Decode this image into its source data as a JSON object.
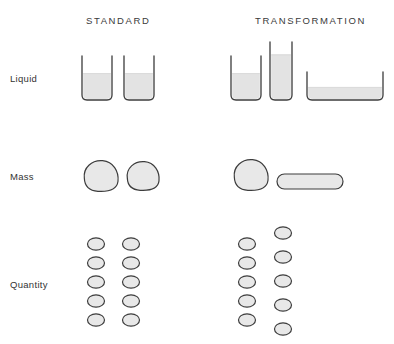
{
  "figure": {
    "title_columns": {
      "standard": "STANDARD",
      "transformation": "TRANSFORMATION"
    },
    "row_labels": {
      "liquid": "Liquid",
      "mass": "Mass",
      "quantity": "Quantity"
    },
    "colors": {
      "background": "#ffffff",
      "outline": "#3c3c3c",
      "fill_light": "#e8e8e8",
      "fill_liquid": "#e3e3e3",
      "text": "#333333"
    }
  },
  "chart_data": {
    "type": "diagram",
    "title": "",
    "rows": [
      {
        "label": "Liquid",
        "standard": {
          "items": [
            {
              "shape": "beaker",
              "x": 82,
              "y": 56,
              "width": 30,
              "height": 44,
              "fill_ratio": 0.6
            },
            {
              "shape": "beaker",
              "x": 124,
              "y": 56,
              "width": 30,
              "height": 44,
              "fill_ratio": 0.6
            }
          ]
        },
        "transformation": {
          "items": [
            {
              "shape": "beaker",
              "x": 231,
              "y": 56,
              "width": 30,
              "height": 44,
              "fill_ratio": 0.6
            },
            {
              "shape": "beaker-tall",
              "x": 270,
              "y": 42,
              "width": 22,
              "height": 58,
              "fill_ratio": 0.78
            },
            {
              "shape": "beaker-wide",
              "x": 307,
              "y": 72,
              "width": 76,
              "height": 28,
              "fill_ratio": 0.45
            }
          ]
        }
      },
      {
        "label": "Mass",
        "standard": {
          "items": [
            {
              "shape": "blob",
              "cx": 101,
              "cy": 176,
              "rx": 17,
              "ry": 15
            },
            {
              "shape": "blob",
              "cx": 143,
              "cy": 176,
              "rx": 16,
              "ry": 14
            }
          ]
        },
        "transformation": {
          "items": [
            {
              "shape": "blob",
              "cx": 251,
              "cy": 175,
              "rx": 17,
              "ry": 15
            },
            {
              "shape": "sausage",
              "x": 277,
              "y": 174,
              "width": 66,
              "height": 15
            }
          ]
        }
      },
      {
        "label": "Quantity",
        "standard": {
          "columns": [
            {
              "count": 5,
              "cx": 96,
              "y_start": 244,
              "spacing": 19
            },
            {
              "count": 5,
              "cx": 131,
              "y_start": 244,
              "spacing": 19
            }
          ]
        },
        "transformation": {
          "columns": [
            {
              "count": 5,
              "cx": 247,
              "y_start": 244,
              "spacing": 19
            },
            {
              "count": 5,
              "cx": 283,
              "y_start": 233,
              "spacing": 24
            }
          ]
        }
      }
    ]
  }
}
